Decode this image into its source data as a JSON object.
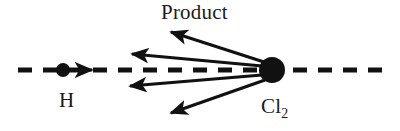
{
  "figure": {
    "kind": "reaction-scattering-diagram",
    "width": 400,
    "height": 131,
    "background_color": "#FFFFFF",
    "ink_color": "#111111"
  },
  "labels": {
    "product": "Product",
    "reactant_atom": "H",
    "target_molecule_element": "Cl",
    "target_molecule_subscript": "2"
  },
  "chart_data": {
    "type": "scatter",
    "title": "",
    "xlabel": "",
    "ylabel": "",
    "axis_line": {
      "name": "collision-axis",
      "style": "dashed",
      "x_start": 18,
      "x_end": 386,
      "y": 70,
      "dash_length": 14,
      "gap_length": 11,
      "stroke_width": 5
    },
    "particles": [
      {
        "name": "hydrogen-atom",
        "label": "H",
        "cx": 63,
        "cy": 70,
        "r": 7
      },
      {
        "name": "chlorine-molecule",
        "label": "Cl2",
        "cx": 272,
        "cy": 70,
        "r": 13
      }
    ],
    "incoming_arrow": {
      "name": "incoming-velocity-arrow",
      "x1": 73,
      "y1": 70,
      "x2": 92,
      "y2": 70,
      "stroke_width": 3
    },
    "product_arrows": [
      {
        "name": "product-arrow-1",
        "x1": 264,
        "y1": 62,
        "x2": 171,
        "y2": 32,
        "stroke_width": 3
      },
      {
        "name": "product-arrow-2",
        "x1": 262,
        "y1": 66,
        "x2": 132,
        "y2": 54,
        "stroke_width": 3
      },
      {
        "name": "product-arrow-3",
        "x1": 262,
        "y1": 75,
        "x2": 130,
        "y2": 86,
        "stroke_width": 3
      },
      {
        "name": "product-arrow-4",
        "x1": 265,
        "y1": 80,
        "x2": 171,
        "y2": 113,
        "stroke_width": 3
      }
    ]
  }
}
